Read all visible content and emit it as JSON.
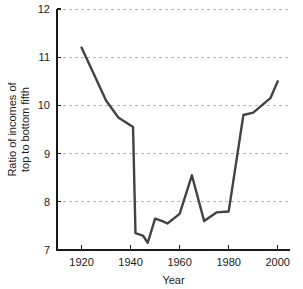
{
  "chart_data": {
    "type": "line",
    "title": "",
    "xlabel": "Year",
    "ylabel": "Ratio of incomes of top to bottom fifth",
    "ylabel_line1": "Ratio of incomes of",
    "ylabel_line2": "top to bottom fifth",
    "xlim": [
      1910,
      2005
    ],
    "ylim": [
      7,
      12
    ],
    "grid": true,
    "grid_axis": "y",
    "legend": "none",
    "line_color": "#434343",
    "grid_color": "#b9b9b9",
    "axis_color": "#1a1a1a",
    "xticks": [
      1920,
      1940,
      1960,
      1980,
      2000
    ],
    "xtick_labels": [
      "1920",
      "1940",
      "1960",
      "1980",
      "2000"
    ],
    "yticks": [
      7,
      8,
      9,
      10,
      11,
      12
    ],
    "ytick_labels": [
      "7",
      "8",
      "9",
      "10",
      "11",
      "12"
    ],
    "series": [
      {
        "name": "Ratio of incomes of top to bottom fifth",
        "x": [
          1920,
          1930,
          1935,
          1941,
          1942,
          1945,
          1947,
          1950,
          1953,
          1955,
          1960,
          1965,
          1970,
          1975,
          1980,
          1986,
          1990,
          1997,
          2000
        ],
        "values": [
          11.2,
          10.1,
          9.75,
          9.55,
          7.35,
          7.3,
          7.15,
          7.65,
          7.6,
          7.55,
          7.75,
          8.55,
          7.6,
          7.78,
          7.8,
          9.8,
          9.85,
          10.15,
          10.5
        ]
      }
    ]
  }
}
